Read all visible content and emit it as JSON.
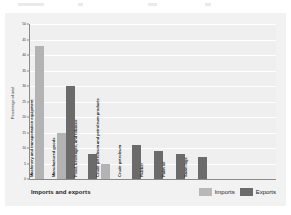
{
  "chart_data": {
    "type": "bar",
    "title": "",
    "xlabel": "Imports and exports",
    "ylabel": "Percentage of total",
    "ylim": [
      0,
      50
    ],
    "yticks": [
      0,
      5,
      10,
      15,
      20,
      25,
      30,
      35,
      40,
      45,
      50
    ],
    "grid": true,
    "legend_position": "bottom-right",
    "categories": [
      "Machinery and transportation equipment",
      "Manufactured goods",
      "Food, beverages, and tobacco",
      "Crude petroleum and petroleum products",
      "Crude petroleum",
      "Rubber",
      "Palm oil",
      "Sawn logs"
    ],
    "series": [
      {
        "name": "Imports",
        "color": "#b3b3b3",
        "values": [
          43,
          15,
          null,
          5,
          null,
          null,
          null,
          null
        ]
      },
      {
        "name": "Exports",
        "color": "#6b6b6b",
        "values": [
          null,
          30,
          8,
          null,
          11,
          9,
          8,
          7
        ]
      }
    ]
  },
  "axis": {
    "y_title": "Percentage of total",
    "x_title": "Imports and exports",
    "tick_labels": [
      "0",
      "5",
      "10",
      "15",
      "20",
      "25",
      "30",
      "35",
      "40",
      "45",
      "50"
    ]
  },
  "legend": {
    "items": [
      {
        "label": "Imports",
        "color": "#b8b8b8"
      },
      {
        "label": "Exports",
        "color": "#6b6b6b"
      }
    ]
  }
}
